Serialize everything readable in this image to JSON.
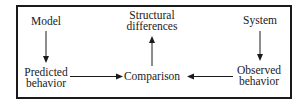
{
  "diagram": {
    "nodes": {
      "model": {
        "label": "Model"
      },
      "system": {
        "label": "System"
      },
      "predicted_behavior": {
        "line1": "Predicted",
        "line2": "behavior"
      },
      "observed_behavior": {
        "line1": "Observed",
        "line2": "behavior"
      },
      "comparison": {
        "label": "Comparison"
      },
      "structural_differences": {
        "line1": "Structural",
        "line2": "differences"
      }
    },
    "edges": [
      {
        "from": "Model",
        "to": "Predicted behavior",
        "direction": "down"
      },
      {
        "from": "System",
        "to": "Observed behavior",
        "direction": "down"
      },
      {
        "from": "Predicted behavior",
        "to": "Comparison",
        "direction": "right"
      },
      {
        "from": "Observed behavior",
        "to": "Comparison",
        "direction": "left"
      },
      {
        "from": "Comparison",
        "to": "Structural differences",
        "direction": "up"
      }
    ],
    "colors": {
      "ink": "#1a1a1a",
      "background": "#ffffff"
    }
  }
}
